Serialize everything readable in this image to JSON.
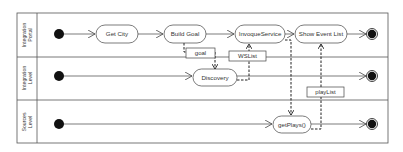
{
  "lanes": [
    {
      "id": "portal",
      "label_line1": "Integration",
      "label_line2": "Portal"
    },
    {
      "id": "level",
      "label_line1": "Integration",
      "label_line2": "Level"
    },
    {
      "id": "sources",
      "label_line1": "Sources",
      "label_line2": "Level"
    }
  ],
  "activities": {
    "get_city": "Get City",
    "build_goal": "Build Goal",
    "invoque_service": "InvoqueService",
    "show_event_list": "Show Event List",
    "discovery": "Discovery",
    "get_plays": "getPlays()"
  },
  "objects": {
    "goal": "goal",
    "ws_list": "WSList",
    "play_list": "playList"
  },
  "colors": {
    "line": "#444444",
    "node_fill": "#ffffff",
    "terminal": "#111111"
  }
}
